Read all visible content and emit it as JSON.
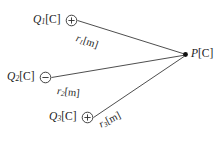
{
  "figure": {
    "type": "electrostatics-point-charge-diagram",
    "background_color": "#ffffff",
    "line_color": "#3a3a3a",
    "text_color": "#1a1a1a"
  },
  "charges": [
    {
      "id": "q1",
      "symbol": "Q",
      "subscript": "1",
      "unit": "[C]",
      "polarity": "positive",
      "polarity_glyph": "plus-in-circle",
      "marker_name": "positive-charge-marker"
    },
    {
      "id": "q2",
      "symbol": "Q",
      "subscript": "2",
      "unit": "[C]",
      "polarity": "negative",
      "polarity_glyph": "minus-in-circle",
      "marker_name": "negative-charge-marker"
    },
    {
      "id": "q3",
      "symbol": "Q",
      "subscript": "3",
      "unit": "[C]",
      "polarity": "positive",
      "polarity_glyph": "plus-in-circle",
      "marker_name": "positive-charge-marker"
    }
  ],
  "distances": [
    {
      "id": "r1",
      "symbol": "r",
      "subscript": "1",
      "unit": "[m]"
    },
    {
      "id": "r2",
      "symbol": "r",
      "subscript": "2",
      "unit": "[m]"
    },
    {
      "id": "r3",
      "symbol": "r",
      "subscript": "3",
      "unit": "[m]"
    }
  ],
  "field_point": {
    "symbol": "P",
    "unit": "[C]",
    "marker_name": "field-point-dot"
  }
}
